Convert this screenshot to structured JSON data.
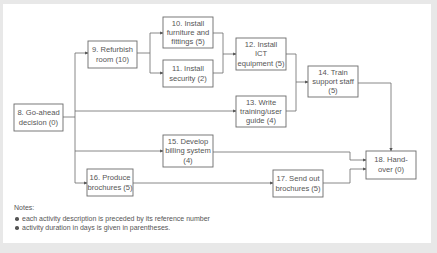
{
  "diagram": {
    "type": "activity-network",
    "nodes": [
      {
        "id": "8",
        "lines": [
          "8. Go-ahead",
          "decision (0)"
        ],
        "label": "Go-ahead decision",
        "duration": 0
      },
      {
        "id": "9",
        "lines": [
          "9. Refurbish",
          "room (10)"
        ],
        "label": "Refurbish room",
        "duration": 10
      },
      {
        "id": "10",
        "lines": [
          "10. Install",
          "furniture and",
          "fittings (5)"
        ],
        "label": "Install furniture and fittings",
        "duration": 5
      },
      {
        "id": "11",
        "lines": [
          "11. Install",
          "security (2)"
        ],
        "label": "Install security",
        "duration": 2
      },
      {
        "id": "12",
        "lines": [
          "12. Install",
          "ICT",
          "equipment (5)"
        ],
        "label": "Install ICT equipment",
        "duration": 5
      },
      {
        "id": "13",
        "lines": [
          "13. Write",
          "training/user",
          "guide (4)"
        ],
        "label": "Write training/user guide",
        "duration": 4
      },
      {
        "id": "14",
        "lines": [
          "14. Train",
          "support staff",
          "(5)"
        ],
        "label": "Train support staff",
        "duration": 5
      },
      {
        "id": "15",
        "lines": [
          "15. Develop",
          "billing system",
          "(4)"
        ],
        "label": "Develop billing system",
        "duration": 4
      },
      {
        "id": "16",
        "lines": [
          "16. Produce",
          "brochures (5)"
        ],
        "label": "Produce brochures",
        "duration": 5
      },
      {
        "id": "17",
        "lines": [
          "17. Send out",
          "brochures (5)"
        ],
        "label": "Send out brochures",
        "duration": 5
      },
      {
        "id": "18",
        "lines": [
          "18. Hand-",
          "over (0)"
        ],
        "label": "Hand-over",
        "duration": 0
      }
    ],
    "edges": [
      [
        "8",
        "9"
      ],
      [
        "8",
        "13"
      ],
      [
        "8",
        "15"
      ],
      [
        "8",
        "16"
      ],
      [
        "9",
        "10"
      ],
      [
        "9",
        "11"
      ],
      [
        "10",
        "12"
      ],
      [
        "11",
        "12"
      ],
      [
        "12",
        "14"
      ],
      [
        "13",
        "14"
      ],
      [
        "14",
        "18"
      ],
      [
        "15",
        "18"
      ],
      [
        "16",
        "17"
      ],
      [
        "17",
        "18"
      ]
    ]
  },
  "notes": {
    "title": "Notes:",
    "items": [
      "each activity description is preceded by its reference number",
      "activity duration in days is given in parentheses."
    ]
  }
}
